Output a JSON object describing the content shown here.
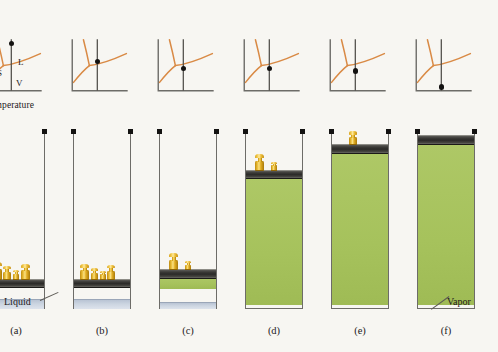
{
  "figure": {
    "title_alt": "Pressure-temperature phase diagram sequence with piston-cylinder states",
    "axis": {
      "y_label": "Pressure",
      "x_label": "Temperature"
    },
    "regions": {
      "solid": "S",
      "liquid": "L",
      "vapor": "V"
    },
    "callouts": {
      "liquid": "Liquid",
      "vapor": "Vapor"
    },
    "colors": {
      "curve": "#d98a45",
      "vapor_fill": "#a9c45f",
      "liquid_fill": "#ccd5e1",
      "piston": "#2b2a28",
      "weight": "#e9bb33",
      "wall": "#6d6c68",
      "background": "#f7f6f2",
      "text": "#23201c"
    },
    "panels": [
      {
        "id": "a",
        "label": "(a)",
        "state_dot": {
          "x_pct": 52,
          "y_pct": 8,
          "region": "liquid-high-pressure"
        },
        "show_axis_labels": true,
        "show_region_labels": true,
        "piston_top_pct": 83.5,
        "liquid_height_pct": 5.0,
        "vapor_height_pct": 0,
        "weights": [
          {
            "h": 17,
            "w": 9,
            "x": 5
          },
          {
            "h": 13,
            "w": 8,
            "x": 15
          },
          {
            "h": 9,
            "w": 6,
            "x": 25
          },
          {
            "h": 15,
            "w": 9,
            "x": 33
          }
        ]
      },
      {
        "id": "b",
        "label": "(b)",
        "state_dot": {
          "x_pct": 52,
          "y_pct": 43,
          "region": "liquid-near-curve"
        },
        "show_axis_labels": false,
        "show_region_labels": false,
        "piston_top_pct": 83.5,
        "liquid_height_pct": 5.0,
        "vapor_height_pct": 0,
        "weights": [
          {
            "h": 15,
            "w": 9,
            "x": 6
          },
          {
            "h": 11,
            "w": 7,
            "x": 17
          },
          {
            "h": 8,
            "w": 6,
            "x": 26
          },
          {
            "h": 14,
            "w": 8,
            "x": 33
          }
        ]
      },
      {
        "id": "c",
        "label": "(c)",
        "state_dot": {
          "x_pct": 52,
          "y_pct": 57,
          "region": "on-vaporization-curve"
        },
        "show_axis_labels": false,
        "show_region_labels": false,
        "piston_top_pct": 78.0,
        "liquid_height_pct": 3.2,
        "vapor_height_pct": 7.0,
        "weights": [
          {
            "h": 16,
            "w": 9,
            "x": 9
          },
          {
            "h": 8,
            "w": 6,
            "x": 25
          }
        ]
      },
      {
        "id": "d",
        "label": "(d)",
        "state_dot": {
          "x_pct": 52,
          "y_pct": 57,
          "region": "on-vaporization-curve"
        },
        "show_axis_labels": false,
        "show_region_labels": false,
        "piston_top_pct": 22.0,
        "liquid_height_pct": 0,
        "vapor_height_pct": 72.0,
        "weights": [
          {
            "h": 16,
            "w": 9,
            "x": 9
          },
          {
            "h": 8,
            "w": 6,
            "x": 25
          }
        ]
      },
      {
        "id": "e",
        "label": "(e)",
        "state_dot": {
          "x_pct": 52,
          "y_pct": 62,
          "region": "vapor-near-curve"
        },
        "show_axis_labels": false,
        "show_region_labels": false,
        "piston_top_pct": 7.5,
        "liquid_height_pct": 0,
        "vapor_height_pct": 86.5,
        "weights": [
          {
            "h": 13,
            "w": 8,
            "x": 17
          }
        ]
      },
      {
        "id": "f",
        "label": "(f)",
        "state_dot": {
          "x_pct": 52,
          "y_pct": 93,
          "region": "vapor"
        },
        "show_axis_labels": false,
        "show_region_labels": false,
        "piston_top_pct": 2.5,
        "liquid_height_pct": 0,
        "vapor_height_pct": 91.5,
        "weights": []
      }
    ]
  },
  "chart_data": {
    "type": "line",
    "xlabel": "Temperature",
    "ylabel": "Pressure",
    "grid": false,
    "legend": "none",
    "annotations": [
      "S",
      "L",
      "V"
    ],
    "series": [
      {
        "name": "fusion-curve (solid-liquid)",
        "x": [
          26,
          27,
          29,
          31
        ],
        "y": [
          46,
          34,
          18,
          4
        ]
      },
      {
        "name": "sublimation-curve (solid-vapor)",
        "x": [
          6,
          12,
          19,
          26
        ],
        "y": [
          64,
          58,
          52,
          46
        ]
      },
      {
        "name": "vaporization-curve (liquid-vapor)",
        "x": [
          26,
          36,
          48,
          60,
          72
        ],
        "y": [
          46,
          44,
          41,
          37,
          31
        ]
      }
    ],
    "marker_positions_pct": [
      {
        "panel": "a",
        "x": 52,
        "y": 8
      },
      {
        "panel": "b",
        "x": 52,
        "y": 43
      },
      {
        "panel": "c",
        "x": 52,
        "y": 57
      },
      {
        "panel": "d",
        "x": 52,
        "y": 57
      },
      {
        "panel": "e",
        "x": 52,
        "y": 62
      },
      {
        "panel": "f",
        "x": 52,
        "y": 93
      }
    ]
  }
}
